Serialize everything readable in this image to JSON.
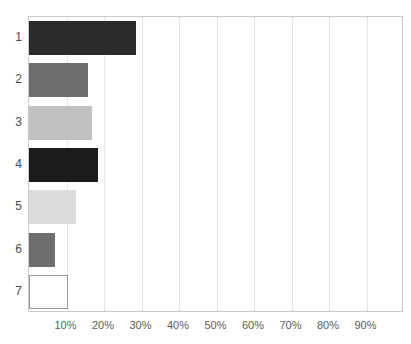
{
  "chart_data": {
    "type": "bar",
    "orientation": "horizontal",
    "title": "",
    "xlabel": "",
    "ylabel": "",
    "categories": [
      "1",
      "2",
      "3",
      "4",
      "5",
      "6",
      "7"
    ],
    "values": [
      28.5,
      15.7,
      16.8,
      18.5,
      12.5,
      7.0,
      10.5
    ],
    "bar_colors": [
      "#2b2b2b",
      "#6e6e6e",
      "#c0c0c0",
      "#1a1a1a",
      "#dcdcdc",
      "#6e6e6e",
      "#ffffff"
    ],
    "bar_border_colors": [
      "#2b2b2b",
      "#6e6e6e",
      "#c0c0c0",
      "#1a1a1a",
      "#dcdcdc",
      "#6e6e6e",
      "#9a9a9a"
    ],
    "xlim": [
      0,
      100
    ],
    "ylim": [
      0,
      7
    ],
    "xtick_values": [
      10,
      20,
      30,
      40,
      50,
      60,
      70,
      80,
      90
    ],
    "xtick_labels": [
      "10%",
      "20%",
      "30%",
      "40%",
      "50%",
      "60%",
      "70%",
      "80%",
      "90%"
    ],
    "grid": true,
    "grid_axis": "x",
    "grid_color": "#e3e6e9",
    "legend": false,
    "frame_color": "#c8ccd0",
    "background": "#ffffff"
  },
  "axes": {
    "y_categories": [
      "1",
      "2",
      "3",
      "4",
      "5",
      "6",
      "7"
    ],
    "x_ticks": [
      "10%",
      "20%",
      "30%",
      "40%",
      "50%",
      "60%",
      "70%",
      "80%",
      "90%"
    ]
  },
  "header": {
    "clipped_title": ""
  }
}
